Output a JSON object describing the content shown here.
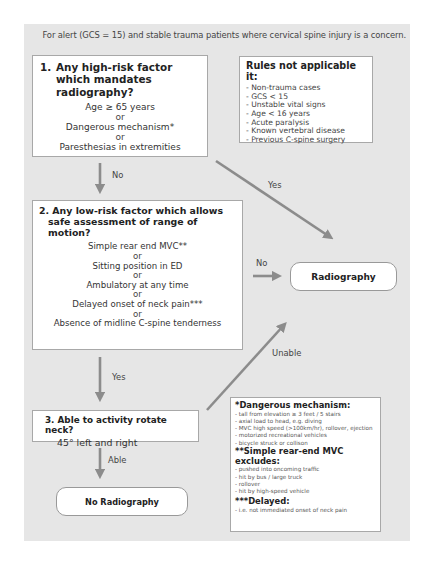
{
  "intro": "For alert (GCS = 15) and stable trauma patients where cervical spine injury is a concern.",
  "question1": {
    "number": "1.",
    "title": "Any high-risk factor which mandates radiography?",
    "criteria": [
      "Age ≥ 65 years",
      "Dangerous mechanism*",
      "Paresthesias in extremities"
    ],
    "separator": "or"
  },
  "rules": {
    "title": "Rules not applicable it:",
    "items": [
      "- Non-trauma cases",
      "- GCS < 15",
      "- Unstable vital signs",
      "- Age < 16 years",
      "- Acute paralysis",
      "- Known vertebral disease",
      "- Previous C-spine surgery"
    ]
  },
  "question2": {
    "line1": "2. Any low-risk factor which allows",
    "line2": "safe assessment of range of motion?",
    "criteria": [
      "Simple rear end MVC**",
      "Sitting position in ED",
      "Ambulatory at any time",
      "Delayed onset of neck pain***",
      "Absence of midline C-spine tenderness"
    ],
    "separator": "or"
  },
  "question3": {
    "title": "3.  Able to activity rotate neck?",
    "detail": "45° left and right"
  },
  "outcomes": {
    "radiography": "Radiography",
    "no_radiography": "No Radiography"
  },
  "arrow_labels": {
    "q1_no": "No",
    "q1_yes": "Yes",
    "q2_no": "No",
    "q2_yes": "Yes",
    "q3_unable": "Unable",
    "q3_able": "Able"
  },
  "notes": {
    "dangerous": {
      "title": "*Dangerous mechanism:",
      "items": [
        "- tall from elevation ≥ 3 feet / 5 stairs",
        "- axial load to head, e.g. diving",
        "- MVC high speed (>100km/hr), rollover, ejection",
        "- motorized recreational vehicles",
        "- bicycle struck or collison"
      ]
    },
    "rear_end": {
      "title": "**Simple rear-end MVC excludes:",
      "items": [
        "- pushed into oncoming traffic",
        "- hit by bus / large truck",
        "- rollover",
        "- hit by high-speed vehicle"
      ]
    },
    "delayed": {
      "title": "***Delayed:",
      "items": [
        "- i.e. not immediated onset of neck pain"
      ]
    }
  },
  "colors": {
    "panel": "#e6e6e6",
    "arrow": "#8c8c8c",
    "box_border": "#a8a8a8"
  }
}
